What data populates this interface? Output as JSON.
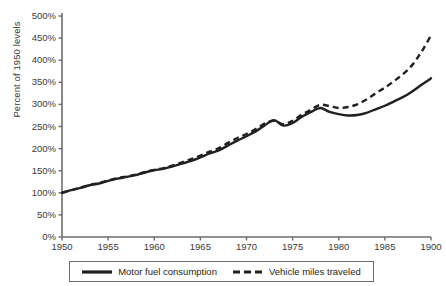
{
  "chart_data": {
    "type": "line",
    "title": "",
    "xlabel": "",
    "ylabel": "Percent of 1950 levels",
    "xlim": [
      1950,
      1990
    ],
    "ylim": [
      0,
      500
    ],
    "grid": false,
    "legend_position": "bottom",
    "xticks": [
      "1950",
      "1955",
      "1960",
      "1965",
      "1970",
      "1975",
      "1980",
      "1985",
      "1900"
    ],
    "xtick_values": [
      1950,
      1955,
      1960,
      1965,
      1970,
      1975,
      1980,
      1985,
      1990
    ],
    "yticks": [
      "0%",
      "50%",
      "100%",
      "150%",
      "200%",
      "250%",
      "300%",
      "350%",
      "400%",
      "450%",
      "500%"
    ],
    "ytick_values": [
      0,
      50,
      100,
      150,
      200,
      250,
      300,
      350,
      400,
      450,
      500
    ],
    "x": [
      1950,
      1951,
      1952,
      1953,
      1954,
      1955,
      1956,
      1957,
      1958,
      1959,
      1960,
      1961,
      1962,
      1963,
      1964,
      1965,
      1966,
      1967,
      1968,
      1969,
      1970,
      1971,
      1972,
      1973,
      1974,
      1975,
      1976,
      1977,
      1978,
      1979,
      1980,
      1981,
      1982,
      1983,
      1984,
      1985,
      1986,
      1987,
      1988,
      1989,
      1990
    ],
    "series": [
      {
        "name": "Motor fuel consumption",
        "style": "solid",
        "color": "#231f20",
        "values": [
          100,
          106,
          111,
          117,
          121,
          127,
          132,
          136,
          140,
          146,
          151,
          154,
          160,
          166,
          172,
          180,
          189,
          196,
          207,
          218,
          228,
          239,
          253,
          264,
          252,
          258,
          272,
          283,
          292,
          283,
          278,
          275,
          276,
          281,
          289,
          297,
          307,
          317,
          330,
          345,
          359
        ],
        "final_value": 359
      },
      {
        "name": "Vehicle miles traveled",
        "style": "dashed",
        "color": "#231f20",
        "values": [
          100,
          106,
          112,
          118,
          122,
          128,
          133,
          137,
          141,
          147,
          152,
          156,
          162,
          169,
          176,
          184,
          193,
          201,
          213,
          224,
          233,
          244,
          257,
          263,
          255,
          263,
          277,
          288,
          299,
          296,
          292,
          294,
          300,
          311,
          325,
          338,
          353,
          369,
          390,
          420,
          456
        ],
        "final_value": 456
      }
    ]
  },
  "legend": {
    "items": [
      {
        "label": "Motor fuel consumption",
        "style": "solid"
      },
      {
        "label": "Vehicle miles traveled",
        "style": "dashed"
      }
    ]
  }
}
